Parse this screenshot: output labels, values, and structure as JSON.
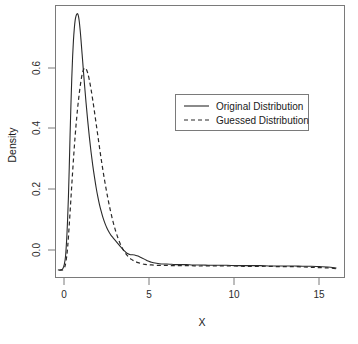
{
  "chart_data": {
    "type": "line",
    "title": "",
    "subtitle": "",
    "xlabel": "X",
    "ylabel": "Density",
    "xlim": [
      -0.75,
      16.5
    ],
    "ylim": [
      -0.035,
      0.79
    ],
    "grid": false,
    "legend_position": "upper-right-inside",
    "xticks": [
      0,
      5,
      10,
      15
    ],
    "xtick_labels": [
      "0",
      "5",
      "10",
      "15"
    ],
    "yticks": [
      0.0,
      0.2,
      0.4,
      0.6
    ],
    "ytick_labels": [
      "0.0",
      "0.2",
      "0.4",
      "0.6"
    ],
    "series": [
      {
        "name": "Original Distribution",
        "style": "solid",
        "color": "#2a2a2a",
        "peak_x": 0.6,
        "peak_y": 0.765,
        "x": [
          -0.55,
          -0.45,
          -0.35,
          -0.28,
          -0.2,
          -0.12,
          -0.05,
          0.0,
          0.05,
          0.1,
          0.15,
          0.2,
          0.25,
          0.3,
          0.35,
          0.4,
          0.45,
          0.5,
          0.55,
          0.6,
          0.65,
          0.7,
          0.75,
          0.8,
          0.9,
          1.0,
          1.1,
          1.2,
          1.3,
          1.4,
          1.5,
          1.6,
          1.7,
          1.8,
          1.9,
          2.0,
          2.1,
          2.2,
          2.3,
          2.4,
          2.5,
          2.6,
          2.7,
          2.8,
          2.9,
          3.0,
          3.1,
          3.2,
          3.3,
          3.4,
          3.5,
          3.6,
          3.7,
          3.8,
          3.9,
          4.0,
          4.2,
          4.4,
          4.6,
          4.8,
          5.0,
          5.3,
          5.6,
          5.9,
          6.2,
          6.5,
          6.8,
          7.1,
          7.4,
          7.7,
          8.0,
          8.5,
          9.0,
          9.5,
          10.0,
          10.5,
          11.0,
          11.5,
          12.0,
          12.5,
          13.0,
          13.5,
          14.0,
          14.5,
          15.0,
          15.5,
          16.0
        ],
        "y": [
          -0.012,
          -0.012,
          -0.011,
          -0.008,
          0.004,
          0.03,
          0.085,
          0.14,
          0.21,
          0.3,
          0.4,
          0.49,
          0.57,
          0.635,
          0.685,
          0.72,
          0.745,
          0.758,
          0.764,
          0.765,
          0.757,
          0.74,
          0.715,
          0.685,
          0.62,
          0.555,
          0.495,
          0.44,
          0.39,
          0.345,
          0.305,
          0.27,
          0.238,
          0.21,
          0.186,
          0.166,
          0.148,
          0.133,
          0.12,
          0.109,
          0.1,
          0.092,
          0.086,
          0.08,
          0.074,
          0.068,
          0.062,
          0.056,
          0.05,
          0.045,
          0.04,
          0.037,
          0.035,
          0.034,
          0.034,
          0.033,
          0.03,
          0.025,
          0.02,
          0.015,
          0.011,
          0.008,
          0.006,
          0.006,
          0.005,
          0.004,
          0.004,
          0.004,
          0.003,
          0.003,
          0.003,
          0.002,
          0.002,
          0.002,
          0.001,
          0.001,
          0.001,
          0.001,
          0.0,
          0.0,
          0.0,
          0.0,
          -0.001,
          -0.001,
          -0.002,
          -0.003,
          -0.006
        ]
      },
      {
        "name": "Guessed Distribution",
        "style": "dashed",
        "color": "#2a2a2a",
        "peak_x": 1.0,
        "peak_y": 0.6,
        "x": [
          -0.5,
          -0.4,
          -0.3,
          -0.2,
          -0.1,
          0.0,
          0.1,
          0.2,
          0.3,
          0.4,
          0.5,
          0.6,
          0.7,
          0.8,
          0.9,
          1.0,
          1.1,
          1.2,
          1.3,
          1.4,
          1.5,
          1.6,
          1.7,
          1.8,
          1.9,
          2.0,
          2.1,
          2.2,
          2.3,
          2.4,
          2.5,
          2.6,
          2.7,
          2.8,
          2.9,
          3.0,
          3.1,
          3.2,
          3.3,
          3.4,
          3.5,
          3.6,
          3.7,
          3.8,
          3.9,
          4.0,
          4.2,
          4.4,
          4.6,
          4.8,
          5.0,
          5.3,
          5.6,
          5.9,
          6.2,
          6.5,
          6.8,
          7.1,
          7.4,
          7.7,
          8.0,
          8.5,
          9.0,
          9.5,
          10.0,
          10.5,
          11.0,
          11.5,
          12.0,
          12.5,
          13.0,
          13.5,
          14.0,
          14.5,
          15.0,
          15.5,
          16.0
        ],
        "y": [
          -0.013,
          -0.013,
          -0.012,
          -0.007,
          0.012,
          0.055,
          0.125,
          0.205,
          0.285,
          0.36,
          0.425,
          0.48,
          0.525,
          0.562,
          0.588,
          0.6,
          0.598,
          0.585,
          0.563,
          0.535,
          0.503,
          0.468,
          0.432,
          0.396,
          0.36,
          0.325,
          0.292,
          0.261,
          0.232,
          0.205,
          0.18,
          0.157,
          0.136,
          0.117,
          0.1,
          0.085,
          0.072,
          0.06,
          0.05,
          0.042,
          0.035,
          0.029,
          0.024,
          0.02,
          0.017,
          0.014,
          0.01,
          0.007,
          0.005,
          0.004,
          0.003,
          0.002,
          0.002,
          0.002,
          0.001,
          0.001,
          0.001,
          0.001,
          0.001,
          0.0,
          0.0,
          0.0,
          0.0,
          0.0,
          0.0,
          -0.001,
          -0.001,
          -0.001,
          -0.001,
          -0.002,
          -0.002,
          -0.002,
          -0.003,
          -0.004,
          -0.005,
          -0.006,
          -0.008
        ]
      }
    ]
  },
  "axes": {
    "x_title": "X",
    "y_title": "Density"
  },
  "legend": {
    "entries": [
      {
        "label": "Original Distribution",
        "style": "solid"
      },
      {
        "label": "Guessed Distribution",
        "style": "dashed"
      }
    ]
  },
  "colors": {
    "line": "#2a2a2a",
    "frame": "#7a7a7a",
    "text": "#1a1a1a",
    "background": "#ffffff"
  }
}
